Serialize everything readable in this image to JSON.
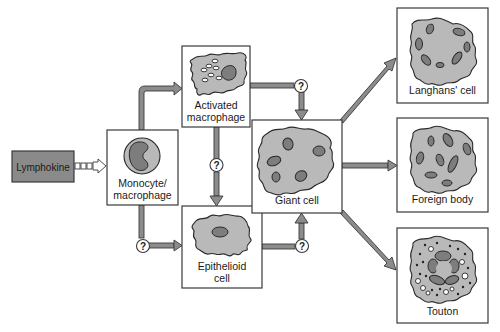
{
  "diagram": {
    "colors": {
      "box_border": "#3a3a3a",
      "cell_fill": "#b9b9b9",
      "nucleus_fill": "#7d7d7d",
      "arrow_fill": "#8c8c8c",
      "lymphokine_fill": "#8a8a8a"
    },
    "nodes": {
      "lymphokine": {
        "label": "Lymphokine"
      },
      "monocyte": {
        "label_line1": "Monocyte/",
        "label_line2": "macrophage"
      },
      "activated": {
        "label_line1": "Activated",
        "label_line2": "macrophage"
      },
      "epithelioid": {
        "label_line1": "Epithelioid",
        "label_line2": "cell"
      },
      "giant": {
        "label": "Giant cell"
      },
      "langhans": {
        "label": "Langhans' cell"
      },
      "foreign": {
        "label": "Foreign body"
      },
      "touton": {
        "label": "Touton"
      }
    },
    "unknown_marker": "?",
    "edges": [
      {
        "from": "Lymphokine",
        "to": "Monocyte/macrophage",
        "style": "dashed"
      },
      {
        "from": "Monocyte/macrophage",
        "to": "Activated macrophage"
      },
      {
        "from": "Monocyte/macrophage",
        "to": "Epithelioid cell",
        "marker": "?"
      },
      {
        "from": "Activated macrophage",
        "to": "Epithelioid cell",
        "marker": "?"
      },
      {
        "from": "Activated macrophage",
        "to": "Giant cell",
        "marker": "?"
      },
      {
        "from": "Epithelioid cell",
        "to": "Giant cell",
        "marker": "?"
      },
      {
        "from": "Giant cell",
        "to": "Langhans' cell"
      },
      {
        "from": "Giant cell",
        "to": "Foreign body"
      },
      {
        "from": "Giant cell",
        "to": "Touton"
      }
    ]
  }
}
